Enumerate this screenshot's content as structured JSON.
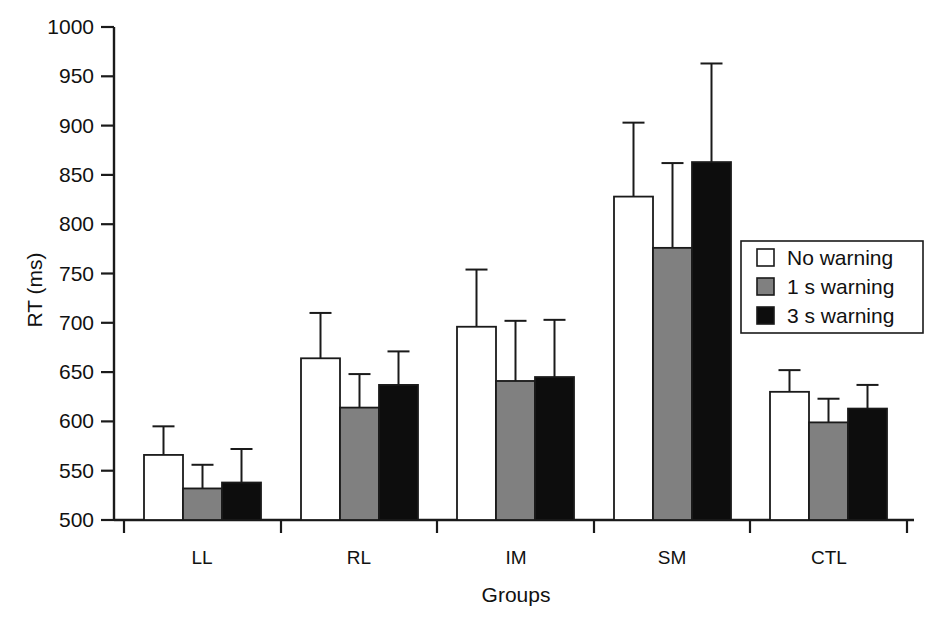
{
  "chart_data": {
    "type": "bar",
    "title": "",
    "subtitle": "",
    "xlabel": "Groups",
    "ylabel": "RT (ms)",
    "categories": [
      "LL",
      "RL",
      "IM",
      "SM",
      "CTL"
    ],
    "ylim": [
      500,
      1000
    ],
    "ytick_step": 50,
    "yticks": [
      500,
      550,
      600,
      650,
      700,
      750,
      800,
      850,
      900,
      950,
      1000
    ],
    "ytick_labels": [
      "500",
      "550",
      "600",
      "650",
      "700",
      "750",
      "800",
      "850",
      "900",
      "950",
      "1000"
    ],
    "grid": false,
    "legend_position": "right-inside",
    "error_bars": "upper-only",
    "series": [
      {
        "name": "No warning",
        "color": "#ffffff",
        "values": [
          566,
          664,
          696,
          828,
          630
        ],
        "errors_upper": [
          595,
          710,
          754,
          903,
          652
        ]
      },
      {
        "name": "1 s warning",
        "color": "#808080",
        "values": [
          532,
          614,
          641,
          776,
          599
        ],
        "errors_upper": [
          556,
          648,
          702,
          862,
          623
        ]
      },
      {
        "name": "3 s warning",
        "color": "#0d0d0d",
        "values": [
          538,
          637,
          645,
          863,
          613
        ],
        "errors_upper": [
          572,
          671,
          703,
          963,
          637
        ]
      }
    ],
    "legend": [
      {
        "label": "No warning",
        "swatch": "#ffffff"
      },
      {
        "label": "1 s warning",
        "swatch": "#808080"
      },
      {
        "label": "3 s warning",
        "swatch": "#0d0d0d"
      }
    ]
  }
}
